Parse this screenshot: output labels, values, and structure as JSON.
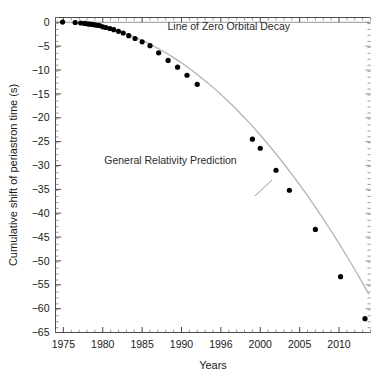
{
  "chart_data": {
    "type": "scatter",
    "title": "",
    "xlabel": "Years",
    "ylabel": "Cumulative shift of periastron time (s)",
    "xlim": [
      1974,
      2014
    ],
    "ylim": [
      -65,
      1
    ],
    "grid": false,
    "legend_position": "none",
    "x_ticks": [
      1975,
      1980,
      1985,
      1990,
      1996,
      2000,
      2005,
      2010
    ],
    "x_tick_values": [
      1975,
      1980,
      1985,
      1990,
      1995,
      2000,
      2005,
      2010
    ],
    "y_ticks": [
      0,
      -5,
      -10,
      -15,
      -20,
      -25,
      -30,
      -35,
      -40,
      -45,
      -50,
      -55,
      -60,
      -65
    ],
    "x_minor_step": 1,
    "y_minor_step": 1.25,
    "annotations": [
      {
        "name": "zero-decay-label",
        "text": "Line of Zero Orbital Decay",
        "x": 1996.0,
        "y": -1.6
      },
      {
        "name": "gr-prediction-label",
        "text": "General Relativity Prediction",
        "x": 1988.6,
        "y": -29.6
      }
    ],
    "reference_line": {
      "name": "zero-orbital-decay-line",
      "y": 0,
      "color": "#8c8c8c"
    },
    "series": [
      {
        "name": "General Relativity Prediction",
        "type": "line",
        "color": "#b3b3b3",
        "x": [
          1974.8,
          1976,
          1977,
          1978,
          1979,
          1980,
          1981,
          1982,
          1983,
          1984,
          1985,
          1986,
          1987,
          1988,
          1989,
          1990,
          1991,
          1992,
          1993,
          1994,
          1995,
          1996,
          1997,
          1998,
          1999,
          2000,
          2001,
          2002,
          2003,
          2004,
          2005,
          2006,
          2007,
          2008,
          2009,
          2010,
          2011,
          2012,
          2013,
          2013.8
        ],
        "values": [
          0.05,
          -0.08,
          -0.21,
          -0.4,
          -0.66,
          -0.99,
          -1.4,
          -1.88,
          -2.44,
          -3.08,
          -3.79,
          -4.58,
          -5.45,
          -6.39,
          -7.41,
          -8.5,
          -9.67,
          -10.92,
          -12.24,
          -13.64,
          -15.11,
          -16.66,
          -18.29,
          -19.99,
          -21.77,
          -23.62,
          -25.55,
          -27.56,
          -29.64,
          -31.8,
          -34.03,
          -36.34,
          -38.73,
          -41.19,
          -43.73,
          -46.34,
          -49.03,
          -51.8,
          -54.64,
          -57.0
        ]
      },
      {
        "name": "Measured cumulative periastron shift",
        "type": "scatter",
        "color": "#000000",
        "x": [
          1974.9,
          1976.5,
          1977.2,
          1977.7,
          1978.1,
          1978.4,
          1978.7,
          1979.0,
          1979.3,
          1979.6,
          1980.0,
          1980.4,
          1980.9,
          1981.4,
          1982.0,
          1982.6,
          1983.3,
          1984.1,
          1985.0,
          1986.0,
          1987.1,
          1988.3,
          1989.5,
          1990.7,
          1992.0,
          1999.0,
          2000.0,
          2002.0,
          2003.7,
          2007.0,
          2010.2,
          2013.3
        ],
        "values": [
          0.05,
          -0.05,
          -0.15,
          -0.25,
          -0.35,
          -0.4,
          -0.45,
          -0.55,
          -0.62,
          -0.7,
          -0.95,
          -1.1,
          -1.3,
          -1.55,
          -1.9,
          -2.25,
          -2.8,
          -3.4,
          -4.1,
          -4.9,
          -6.4,
          -8.0,
          -9.4,
          -11.1,
          -13.0,
          -24.5,
          -26.4,
          -31.0,
          -35.2,
          -43.4,
          -53.3,
          -62.1
        ]
      }
    ]
  },
  "axis": {
    "x_title": "Years",
    "y_title": "Cumulative shift of periastron time (s)"
  }
}
